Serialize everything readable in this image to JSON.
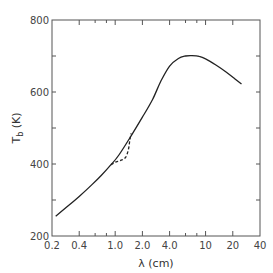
{
  "chart_data": {
    "type": "line",
    "title": "",
    "xlabel": "λ (cm)",
    "ylabel": "T_b (K)",
    "xscale": "log",
    "xlim": [
      0.2,
      40
    ],
    "ylim": [
      200,
      800
    ],
    "xticks": [
      0.2,
      0.4,
      1.0,
      2.0,
      4.0,
      10,
      20,
      40
    ],
    "xtick_labels": [
      "0.2",
      "0.4",
      "1.0",
      "2.0",
      "4.0",
      "10",
      "20",
      "40"
    ],
    "yticks": [
      200,
      400,
      600,
      800
    ],
    "ytick_labels": [
      "200",
      "400",
      "600",
      "800"
    ],
    "grid": false,
    "legend": null,
    "series": [
      {
        "name": "solid",
        "style": "solid",
        "x": [
          0.22,
          0.3,
          0.4,
          0.55,
          0.7,
          0.9,
          1.1,
          1.5,
          2.0,
          2.6,
          3.2,
          4.0,
          5.0,
          6.0,
          7.0,
          8.5,
          10,
          13,
          17,
          21,
          25
        ],
        "y": [
          255,
          283,
          310,
          342,
          368,
          398,
          425,
          478,
          530,
          580,
          630,
          672,
          693,
          700,
          701,
          699,
          692,
          675,
          655,
          637,
          622
        ]
      },
      {
        "name": "dashed",
        "style": "dashed",
        "x": [
          0.9,
          1.0,
          1.15,
          1.3,
          1.4,
          1.45,
          1.5
        ],
        "y": [
          398,
          405,
          410,
          418,
          440,
          465,
          485
        ]
      }
    ]
  },
  "labels": {
    "xlabel": "λ (cm)",
    "ylabel_main": "T",
    "ylabel_sub": "b",
    "ylabel_unit": " (K)"
  }
}
